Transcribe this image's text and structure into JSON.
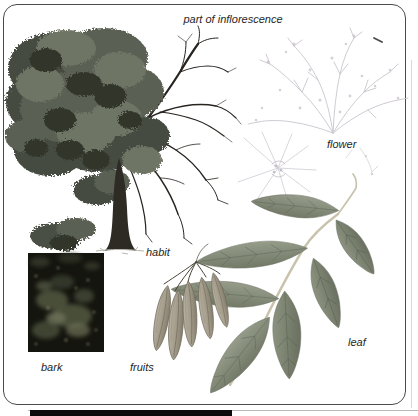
{
  "plate": {
    "labels": {
      "inflorescence": "part of inflorescence",
      "flower": "flower",
      "habit": "habit",
      "bark": "bark",
      "fruits": "fruits",
      "leaf": "leaf"
    },
    "palette": {
      "frame_border": "#4a4a4a",
      "foliage_dark": "#454b40",
      "foliage_mid": "#5a6052",
      "foliage_light": "#6e7465",
      "branch": "#282420",
      "trunk": "#2e2a24",
      "bark_bg": "#15150f",
      "bark_moss": "#515741",
      "fruit_light": "#b8b0a0",
      "fruit_dark": "#857d6c",
      "leaf_light": "#9aa08e",
      "leaf_dark": "#6b7261",
      "rachis": "#c9c2ad",
      "inflorescence_sketch": "#c6c2cb",
      "label_text": "#262626",
      "footer_bar": "#0c0c0c"
    }
  }
}
